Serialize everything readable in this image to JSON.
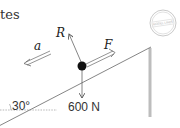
{
  "fragment_text": "tes",
  "labels": {
    "reaction": "R",
    "force": "F",
    "acceleration": "a",
    "angle": "30°",
    "weight": "600 N"
  },
  "stamp": {
    "text": "MODEL LINES"
  },
  "colors": {
    "line": "#555555",
    "ball": "#111111",
    "wall": "#bdbdbd",
    "stamp": "#bbbbbb"
  }
}
